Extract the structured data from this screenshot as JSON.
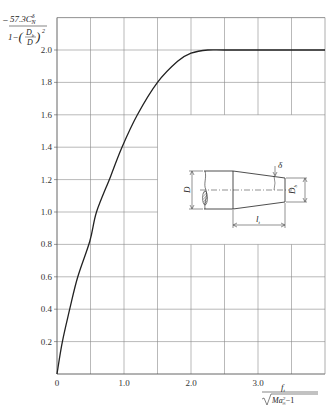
{
  "chart_data": {
    "type": "line",
    "title": "",
    "ylabel": "-57.3 C^δ_N / (1 - (D_b/D)^2)",
    "ylabel_parts": {
      "numerator": "57.3C",
      "numerator_sup": "δ",
      "numerator_sub": "N",
      "denominator_prefix": "1−",
      "frac_num": "D",
      "frac_num_sub": "b",
      "frac_den": "D",
      "exponent": "2",
      "sign": "−"
    },
    "xlabel": "f_t / sqrt(Ma^2_∞ - 1)",
    "xlabel_parts": {
      "numerator": "f",
      "numerator_sub": "t",
      "denominator": "Ma",
      "denominator_sup": "2",
      "denominator_sub": "∞",
      "denominator_tail": "−1"
    },
    "xlim": [
      0,
      4.0
    ],
    "ylim": [
      0,
      2.2
    ],
    "x_ticks": [
      {
        "value": 0,
        "label": "0"
      },
      {
        "value": 1.0,
        "label": "1.0"
      },
      {
        "value": 2.0,
        "label": "2.0"
      },
      {
        "value": 3.0,
        "label": "3.0"
      }
    ],
    "y_ticks": [
      {
        "value": 0.2,
        "label": "0.2"
      },
      {
        "value": 0.4,
        "label": "0.4"
      },
      {
        "value": 0.6,
        "label": "0.6"
      },
      {
        "value": 0.8,
        "label": "0.8"
      },
      {
        "value": 1.0,
        "label": "1.0"
      },
      {
        "value": 1.2,
        "label": "1.2"
      },
      {
        "value": 1.4,
        "label": "1.4"
      },
      {
        "value": 1.6,
        "label": "1.6"
      },
      {
        "value": 1.8,
        "label": "1.8"
      },
      {
        "value": 2.0,
        "label": "2.0"
      }
    ],
    "origin_label": "0",
    "grid": true,
    "grid_x_step": 0.5,
    "grid_y_step": 0.2,
    "legend": null,
    "series": [
      {
        "name": "curve",
        "x": [
          0,
          0.08,
          0.19,
          0.31,
          0.49,
          0.59,
          0.8,
          0.97,
          1.2,
          1.5,
          1.8,
          2.0,
          2.25,
          2.5,
          3.0,
          3.5,
          4.0
        ],
        "y": [
          0,
          0.2,
          0.4,
          0.6,
          0.82,
          1.0,
          1.22,
          1.4,
          1.6,
          1.8,
          1.93,
          1.98,
          2.0,
          2.0,
          2.0,
          2.0,
          2.0
        ]
      }
    ],
    "inset_diagram": {
      "description": "boattail geometry sketch",
      "labels": {
        "body_diameter": "D",
        "base_diameter": "D",
        "base_diameter_sub": "b",
        "boattail_length": "l",
        "boattail_length_sub": "t",
        "angle": "δ"
      }
    }
  },
  "colors": {
    "axis": "#555555",
    "grid": "#8a8a8a",
    "curve": "#222222",
    "text": "#333333"
  }
}
